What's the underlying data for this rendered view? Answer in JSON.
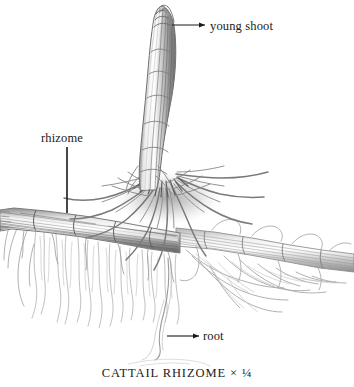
{
  "figure": {
    "caption": "CATTAIL RHIZOME × ¼",
    "medium": "graphite pencil botanical illustration",
    "background_color": "#ffffff",
    "ink_color": "#1a1a1a",
    "width": 354,
    "height": 387
  },
  "labels": {
    "young_shoot": "young shoot",
    "rhizome": "rhizome",
    "root": "root"
  },
  "leaders": {
    "young_shoot": {
      "type": "arrow-horizontal",
      "x1": 172,
      "y1": 25,
      "x2": 207,
      "y2": 25
    },
    "rhizome": {
      "type": "line-vertical",
      "x1": 67,
      "y1": 147,
      "x2": 67,
      "y2": 213
    },
    "root": {
      "type": "arrow-horizontal",
      "x1": 167,
      "y1": 336,
      "x2": 200,
      "y2": 336
    }
  },
  "drawing": {
    "shoot": {
      "name": "young shoot",
      "tip": [
        166,
        6
      ],
      "base": [
        150,
        178
      ],
      "tone": "#8d8d8d"
    },
    "rhizome": {
      "name": "horizontal rhizome",
      "left_end": [
        0,
        216
      ],
      "right_end": [
        354,
        254
      ],
      "tone": "#7a7a7a"
    },
    "root_crown": {
      "name": "dense root crown at shoot base",
      "center": [
        168,
        196
      ],
      "tone": "#6f6f6f"
    },
    "roots": {
      "name": "fine descending roots",
      "extent_y": [
        230,
        352
      ],
      "tone": "#aaaaaa"
    }
  }
}
